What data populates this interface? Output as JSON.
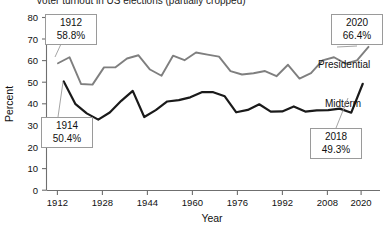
{
  "chart_data": {
    "type": "line",
    "title": "Voter turnout in US elections (partially cropped)",
    "xlabel": "Year",
    "ylabel": "Percent",
    "xlim": [
      1908,
      2024
    ],
    "ylim": [
      0,
      80
    ],
    "ytick_step": 10,
    "yticks": [
      0,
      10,
      20,
      30,
      40,
      50,
      60,
      70,
      80
    ],
    "xticks": [
      1912,
      1928,
      1944,
      1960,
      1976,
      1992,
      2008,
      2020
    ],
    "grid": false,
    "legend_position": "inline-right",
    "series": [
      {
        "name": "Presidential",
        "color": "#7f7f7f",
        "x": [
          1912,
          1916,
          1920,
          1924,
          1928,
          1932,
          1936,
          1940,
          1944,
          1948,
          1952,
          1956,
          1960,
          1964,
          1968,
          1972,
          1976,
          1980,
          1984,
          1988,
          1992,
          1996,
          2000,
          2004,
          2008,
          2012,
          2016,
          2020
        ],
        "values": [
          58.8,
          61.6,
          49.2,
          48.9,
          56.9,
          56.9,
          61.0,
          62.5,
          55.9,
          53.0,
          62.3,
          60.2,
          63.8,
          62.8,
          61.9,
          55.2,
          53.6,
          54.2,
          55.2,
          52.8,
          58.1,
          51.7,
          54.2,
          60.1,
          61.6,
          58.6,
          60.1,
          66.4
        ]
      },
      {
        "name": "Midterm",
        "color": "#1a1a1a",
        "x": [
          1914,
          1918,
          1922,
          1926,
          1930,
          1934,
          1938,
          1942,
          1946,
          1950,
          1954,
          1958,
          1962,
          1966,
          1970,
          1974,
          1978,
          1982,
          1986,
          1990,
          1994,
          1998,
          2002,
          2006,
          2010,
          2014,
          2018
        ],
        "values": [
          50.4,
          40.0,
          35.6,
          32.7,
          36.0,
          41.4,
          46.0,
          33.9,
          37.1,
          41.1,
          41.7,
          43.0,
          45.4,
          45.4,
          43.5,
          36.1,
          37.2,
          39.8,
          36.4,
          36.5,
          38.8,
          36.4,
          37.0,
          37.1,
          37.8,
          35.9,
          49.3
        ]
      }
    ],
    "annotations": [
      {
        "id": "first-presidential",
        "year": "1912",
        "value": "58.8%",
        "series": "Presidential"
      },
      {
        "id": "last-presidential",
        "year": "2020",
        "value": "66.4%",
        "series": "Presidential"
      },
      {
        "id": "first-midterm",
        "year": "1914",
        "value": "50.4%",
        "series": "Midterm"
      },
      {
        "id": "last-midterm",
        "year": "2018",
        "value": "49.3%",
        "series": "Midterm"
      }
    ]
  },
  "axis": {
    "y_label": "Percent",
    "x_label": "Year",
    "yticks": [
      "80",
      "70",
      "60",
      "50",
      "40",
      "30",
      "20",
      "10",
      "0"
    ],
    "xticks": [
      "1912",
      "1928",
      "1944",
      "1960",
      "1976",
      "1992",
      "2008",
      "2020"
    ]
  },
  "labels": {
    "presidential": "Presidential",
    "midterm": "Midterm"
  },
  "callouts": {
    "top_left": {
      "year": "1912",
      "value": "58.8%"
    },
    "top_right": {
      "year": "2020",
      "value": "66.4%"
    },
    "bottom_left": {
      "year": "1914",
      "value": "50.4%"
    },
    "bottom_right": {
      "year": "2018",
      "value": "49.3%"
    }
  },
  "colors": {
    "presidential": "#7f7f7f",
    "midterm": "#1a1a1a",
    "axis": "#6f6f6f",
    "callout_border": "#9a9a9a"
  }
}
